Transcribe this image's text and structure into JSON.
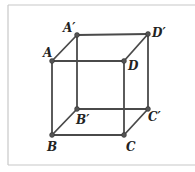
{
  "figure": {
    "type": "cube",
    "frame_color": "#c8c8c8",
    "edge_color": "#4a4a4a",
    "vertex_color": "#555555",
    "label_color": "#222222",
    "vertices": [
      {
        "id": "A",
        "label": "A",
        "x": 52,
        "y": 61,
        "lx": 43,
        "ly": 57
      },
      {
        "id": "D",
        "label": "D",
        "x": 124,
        "y": 61,
        "lx": 128,
        "ly": 70
      },
      {
        "id": "A1",
        "label": "A′",
        "x": 77,
        "y": 35,
        "lx": 63,
        "ly": 32
      },
      {
        "id": "D1",
        "label": "D′",
        "x": 148,
        "y": 34,
        "lx": 152,
        "ly": 37
      },
      {
        "id": "B",
        "label": "B",
        "x": 52,
        "y": 135,
        "lx": 47,
        "ly": 151
      },
      {
        "id": "C",
        "label": "C",
        "x": 124,
        "y": 135,
        "lx": 126,
        "ly": 151
      },
      {
        "id": "B1",
        "label": "B′",
        "x": 77,
        "y": 109,
        "lx": 76,
        "ly": 124
      },
      {
        "id": "C1",
        "label": "C′",
        "x": 148,
        "y": 109,
        "lx": 148,
        "ly": 121
      }
    ],
    "edges": [
      [
        "A",
        "D"
      ],
      [
        "A",
        "A1"
      ],
      [
        "A1",
        "D1"
      ],
      [
        "D",
        "D1"
      ],
      [
        "A",
        "B"
      ],
      [
        "D",
        "C"
      ],
      [
        "A1",
        "B1"
      ],
      [
        "D1",
        "C1"
      ],
      [
        "B",
        "C"
      ],
      [
        "B",
        "B1"
      ],
      [
        "B1",
        "C1"
      ],
      [
        "C",
        "C1"
      ]
    ]
  }
}
